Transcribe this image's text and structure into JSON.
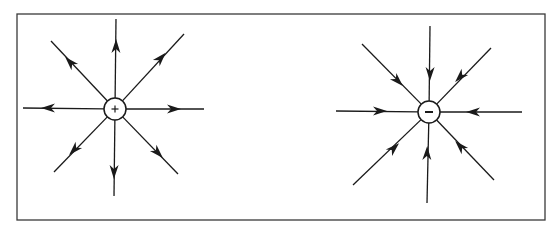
{
  "diagram": {
    "frame": {
      "x": 17,
      "y": 14,
      "width": 528,
      "height": 206,
      "stroke": "#3a3a3a"
    },
    "line_color": "#1a1a1a",
    "charges": [
      {
        "name": "positive-charge",
        "sign": "+",
        "center": [
          115,
          109
        ],
        "radius": 11,
        "field_direction": "outward",
        "lines": [
          {
            "end": [
              116,
              19
            ],
            "arrow": [
              116,
              46
            ]
          },
          {
            "end": [
              114,
              196
            ],
            "arrow": [
              114,
              172
            ]
          },
          {
            "end": [
              23,
              108
            ],
            "arrow": [
              48,
              108
            ]
          },
          {
            "end": [
              204,
              109
            ],
            "arrow": [
              174,
              109
            ]
          },
          {
            "end": [
              51,
              41
            ],
            "arrow": [
              70,
              62
            ]
          },
          {
            "end": [
              184,
              34
            ],
            "arrow": [
              161,
              58
            ]
          },
          {
            "end": [
              54,
              172
            ],
            "arrow": [
              74,
              150
            ]
          },
          {
            "end": [
              178,
              174
            ],
            "arrow": [
              158,
              153
            ]
          }
        ]
      },
      {
        "name": "negative-charge",
        "sign": "−",
        "center": [
          429,
          112
        ],
        "radius": 11,
        "field_direction": "inward",
        "lines": [
          {
            "end": [
              430,
              26
            ],
            "arrow": [
              430,
              74
            ]
          },
          {
            "end": [
              427,
              203
            ],
            "arrow": [
              427,
              153
            ]
          },
          {
            "end": [
              336,
              111
            ],
            "arrow": [
              380,
              111
            ]
          },
          {
            "end": [
              522,
              112
            ],
            "arrow": [
              473,
              112
            ]
          },
          {
            "end": [
              362,
              44
            ],
            "arrow": [
              398,
              81
            ]
          },
          {
            "end": [
              491,
              48
            ],
            "arrow": [
              460,
              77
            ]
          },
          {
            "end": [
              353,
              185
            ],
            "arrow": [
              394,
              148
            ]
          },
          {
            "end": [
              494,
              180
            ],
            "arrow": [
              460,
              146
            ]
          }
        ]
      }
    ]
  }
}
